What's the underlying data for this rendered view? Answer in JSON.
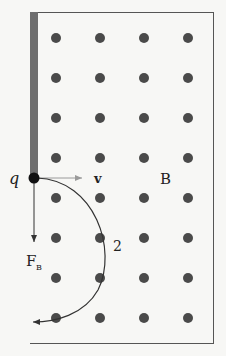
{
  "diagram": {
    "labels": {
      "charge": "q",
      "velocity": "v",
      "field": "B",
      "force_main": "F",
      "force_sub": "B",
      "path": "2"
    },
    "colors": {
      "background": "#f7f7f5",
      "frame": "#555555",
      "barrier": "#6e6e6e",
      "dots": "#4a4a4a",
      "velocity_arrow": "#9a9a9a",
      "force_arrow": "#333333",
      "path": "#333333",
      "charge": "#111111"
    },
    "field_dots": {
      "columns_x": [
        56,
        100,
        144,
        188
      ],
      "rows_y": [
        38,
        78,
        118,
        158,
        198,
        238,
        278,
        318
      ],
      "radius": 5
    }
  }
}
